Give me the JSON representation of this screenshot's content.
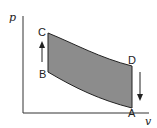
{
  "diagram": {
    "type": "p-v cycle",
    "axes": {
      "y_label": "p",
      "x_label": "v"
    },
    "points": {
      "A": {
        "label": "A"
      },
      "B": {
        "label": "B"
      },
      "C": {
        "label": "C"
      },
      "D": {
        "label": "D"
      }
    },
    "processes": [
      {
        "from": "B",
        "to": "C",
        "direction": "up",
        "arrow": true
      },
      {
        "from": "C",
        "to": "D",
        "shape": "curve-decreasing"
      },
      {
        "from": "D",
        "to": "A",
        "direction": "down",
        "arrow": true
      },
      {
        "from": "A",
        "to": "B",
        "shape": "curve-decreasing"
      }
    ],
    "colors": {
      "fill": "#8c8c8c",
      "stroke": "#222222"
    }
  }
}
